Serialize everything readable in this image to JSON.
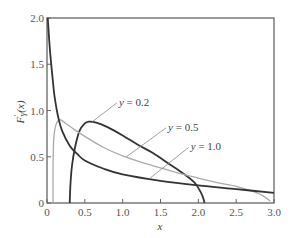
{
  "chart_data": {
    "type": "line",
    "title": "",
    "xlabel": "x",
    "ylabel": "F'_Y(x)",
    "xlim": [
      0,
      3.0
    ],
    "ylim": [
      0,
      2.0
    ],
    "grid": false,
    "legend_position": "inline-annotations",
    "x_ticks": [
      "0",
      "0.5",
      "1.0",
      "1.5",
      "2.0",
      "2.5",
      "3.0"
    ],
    "y_ticks": [
      "0",
      "0.5",
      "1.0",
      "1.5",
      "2.0"
    ],
    "series": [
      {
        "name": "y = 0.2",
        "color": "#333333",
        "points": [
          [
            0.3,
            0.0
          ],
          [
            0.31,
            0.2
          ],
          [
            0.33,
            0.4
          ],
          [
            0.37,
            0.6
          ],
          [
            0.43,
            0.78
          ],
          [
            0.5,
            0.86
          ],
          [
            0.55,
            0.88
          ],
          [
            0.65,
            0.87
          ],
          [
            0.8,
            0.82
          ],
          [
            1.0,
            0.73
          ],
          [
            1.2,
            0.63
          ],
          [
            1.4,
            0.54
          ],
          [
            1.6,
            0.43
          ],
          [
            1.8,
            0.32
          ],
          [
            1.95,
            0.22
          ],
          [
            2.03,
            0.12
          ],
          [
            2.07,
            0.04
          ],
          [
            2.08,
            0.0
          ]
        ]
      },
      {
        "name": "y = 0.5",
        "color": "#aaaaaa",
        "points": [
          [
            0.08,
            0.0
          ],
          [
            0.08,
            0.4
          ],
          [
            0.09,
            0.7
          ],
          [
            0.12,
            0.85
          ],
          [
            0.17,
            0.9
          ],
          [
            0.25,
            0.86
          ],
          [
            0.35,
            0.8
          ],
          [
            0.5,
            0.72
          ],
          [
            0.75,
            0.6
          ],
          [
            1.0,
            0.51
          ],
          [
            1.25,
            0.44
          ],
          [
            1.5,
            0.38
          ],
          [
            1.75,
            0.32
          ],
          [
            2.0,
            0.27
          ],
          [
            2.25,
            0.22
          ],
          [
            2.5,
            0.18
          ],
          [
            2.7,
            0.13
          ],
          [
            2.85,
            0.08
          ],
          [
            2.95,
            0.02
          ]
        ]
      },
      {
        "name": "y = 1.0",
        "color": "#333333",
        "points": [
          [
            0.01,
            2.0
          ],
          [
            0.03,
            1.75
          ],
          [
            0.05,
            1.55
          ],
          [
            0.08,
            1.3
          ],
          [
            0.1,
            1.15
          ],
          [
            0.15,
            0.92
          ],
          [
            0.2,
            0.78
          ],
          [
            0.3,
            0.62
          ],
          [
            0.4,
            0.53
          ],
          [
            0.5,
            0.46
          ],
          [
            0.75,
            0.37
          ],
          [
            1.0,
            0.31
          ],
          [
            1.5,
            0.24
          ],
          [
            2.0,
            0.19
          ],
          [
            2.5,
            0.15
          ],
          [
            3.0,
            0.11
          ]
        ]
      }
    ],
    "annotations": [
      {
        "text": "y = 0.2",
        "label_at": [
          0.95,
          1.05
        ],
        "pointer_to": [
          0.6,
          0.88
        ]
      },
      {
        "text": "y = 0.5",
        "label_at": [
          1.6,
          0.78
        ],
        "pointer_to": [
          1.05,
          0.5
        ]
      },
      {
        "text": "y = 1.0",
        "label_at": [
          1.9,
          0.57
        ],
        "pointer_to": [
          1.35,
          0.26
        ]
      }
    ]
  },
  "labels": {
    "xlabel": "x",
    "ylabel_main": "F",
    "ylabel_sup": "'",
    "ylabel_sub": "Y",
    "ylabel_arg": "(x)",
    "y02": "y = 0.2",
    "y05": "y = 0.5",
    "y10": "y = 1.0"
  }
}
